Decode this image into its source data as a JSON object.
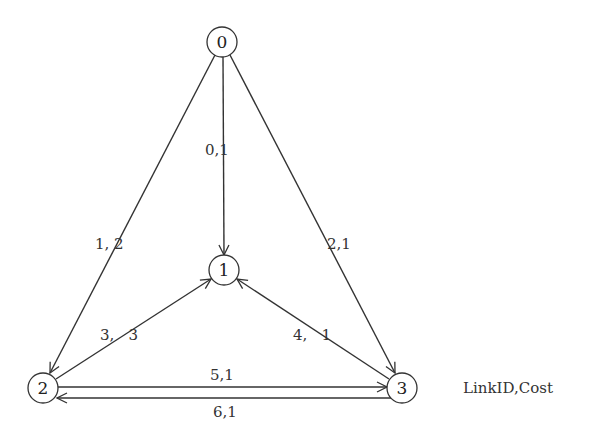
{
  "diagram": {
    "legend": "LinkID,Cost",
    "nodes": [
      {
        "id": "0",
        "label": "0"
      },
      {
        "id": "1",
        "label": "1"
      },
      {
        "id": "2",
        "label": "2"
      },
      {
        "id": "3",
        "label": "3"
      }
    ],
    "edges": [
      {
        "link_id": 0,
        "cost": 1,
        "from": "0",
        "to": "1",
        "label": "0,1"
      },
      {
        "link_id": 1,
        "cost": 2,
        "from": "0",
        "to": "2",
        "label": "1, 2"
      },
      {
        "link_id": 2,
        "cost": 1,
        "from": "0",
        "to": "3",
        "label": "2,1"
      },
      {
        "link_id": 3,
        "cost": 3,
        "from": "2",
        "to": "1",
        "label": "3,   3"
      },
      {
        "link_id": 4,
        "cost": 1,
        "from": "3",
        "to": "1",
        "label": "4,   1"
      },
      {
        "link_id": 5,
        "cost": 1,
        "from": "2",
        "to": "3",
        "label": "5,1"
      },
      {
        "link_id": 6,
        "cost": 1,
        "from": "3",
        "to": "2",
        "label": "6,1"
      }
    ]
  }
}
